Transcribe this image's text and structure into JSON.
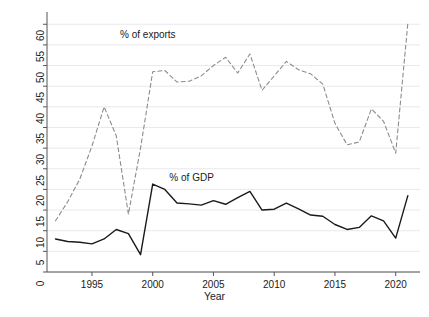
{
  "chart_data": {
    "type": "line",
    "title": "",
    "xlabel": "Year",
    "ylabel": "Total natural resources rents",
    "xlim": [
      1991.3,
      2022.0
    ],
    "ylim": [
      0,
      62
    ],
    "xticks": [
      1995,
      2000,
      2005,
      2010,
      2015,
      2020
    ],
    "xtick_labels": [
      "1995",
      "2000",
      "2005",
      "2010",
      "2015",
      "2020"
    ],
    "yticks": [
      0,
      5,
      10,
      15,
      20,
      25,
      30,
      35,
      40,
      45,
      50,
      55,
      60
    ],
    "ytick_labels": [
      "0",
      "5",
      "10",
      "15",
      "20",
      "25",
      "30",
      "35",
      "40",
      "45",
      "50",
      "55",
      "60"
    ],
    "grid": "horizontal",
    "legend_position": "inline-annotations",
    "x": [
      1992,
      1993,
      1994,
      1995,
      1996,
      1997,
      1998,
      1999,
      2000,
      2001,
      2002,
      2003,
      2004,
      2005,
      2006,
      2007,
      2008,
      2009,
      2010,
      2011,
      2012,
      2013,
      2014,
      2015,
      2016,
      2017,
      2018,
      2019,
      2020,
      2021
    ],
    "series": [
      {
        "name": "% of exports",
        "style": "dashed",
        "color": "#8c8c8c",
        "annotation": "% of exports",
        "values": [
          12.4,
          17.0,
          22.5,
          30.5,
          40.0,
          33.0,
          14.0,
          30.0,
          48.5,
          48.8,
          46.0,
          46.2,
          47.5,
          50.0,
          52.0,
          48.2,
          52.8,
          44.0,
          47.5,
          51.0,
          49.0,
          48.0,
          45.5,
          36.0,
          30.8,
          31.5,
          39.5,
          36.5,
          28.8,
          60.3
        ]
      },
      {
        "name": "% of GDP",
        "style": "solid",
        "color": "#1a1a1a",
        "annotation": "% of GDP",
        "values": [
          8.0,
          7.4,
          7.2,
          6.8,
          8.0,
          10.3,
          9.3,
          4.2,
          21.3,
          20.0,
          16.7,
          16.5,
          16.2,
          17.3,
          16.4,
          18.0,
          19.5,
          15.0,
          15.2,
          16.7,
          15.3,
          13.8,
          13.5,
          11.5,
          10.3,
          10.8,
          13.6,
          12.4,
          8.2,
          18.5
        ]
      }
    ],
    "annotations": [
      {
        "text": "% of exports",
        "x": 1999.6,
        "y": 57.2
      },
      {
        "text": "% of GDP",
        "x": 2003.2,
        "y": 22.5
      }
    ]
  }
}
